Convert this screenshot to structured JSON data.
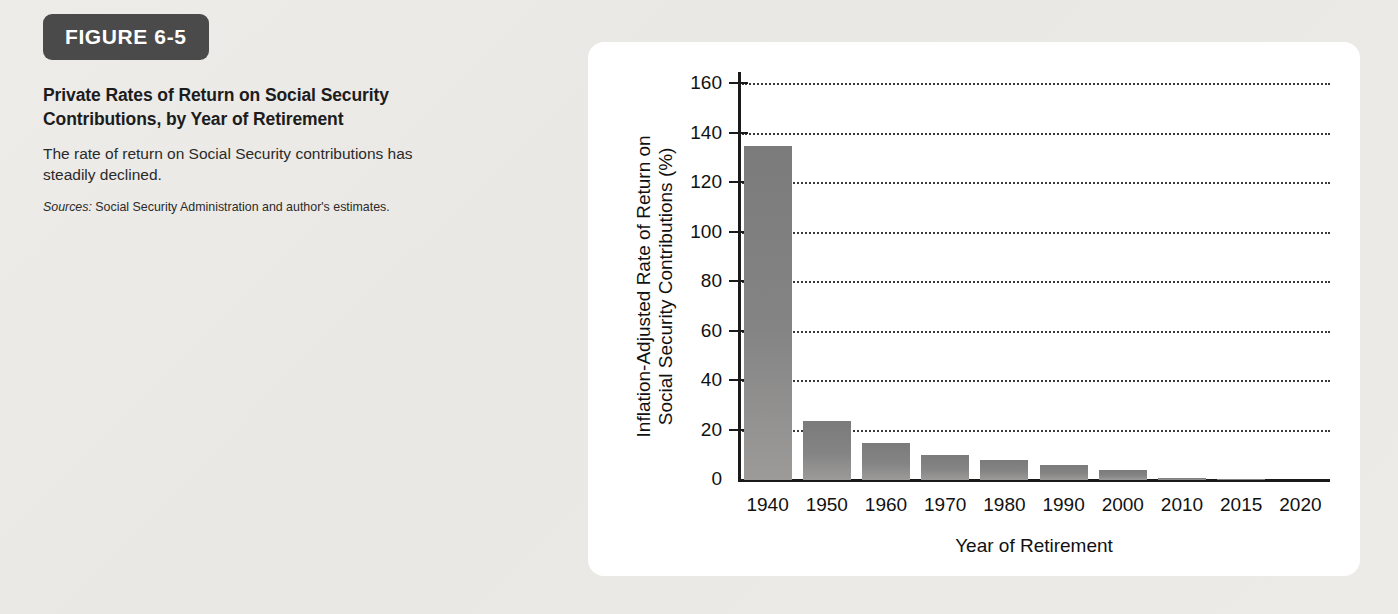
{
  "figure": {
    "badge": "FIGURE 6-5",
    "title": "Private Rates of Return on Social Security Contributions, by Year of Retirement",
    "description": "The rate of return on Social Security contributions has steadily declined.",
    "source_label": "Sources:",
    "source_text": " Social Security Administration and author's estimates."
  },
  "colors": {
    "page_background": "#eeece9",
    "badge_background": "#4a4a4a",
    "badge_text": "#ffffff",
    "card_background": "#ffffff",
    "bar_fill": "#858484",
    "axis": "#1a1a1a",
    "gridline": "#3a3a3a"
  },
  "chart_data": {
    "type": "bar",
    "title": "Private Rates of Return on Social Security Contributions, by Year of Retirement",
    "xlabel": "Year of Retirement",
    "ylabel": "Inflation-Adjusted Rate of Return on\nSocial Security Contributions (%)",
    "categories": [
      "1940",
      "1950",
      "1960",
      "1970",
      "1980",
      "1990",
      "2000",
      "2010",
      "2015",
      "2020"
    ],
    "values": [
      135,
      24,
      15,
      10,
      8,
      6,
      4,
      1,
      0.5,
      0
    ],
    "ylim": [
      0,
      160
    ],
    "yticks": [
      0,
      20,
      40,
      60,
      80,
      100,
      120,
      140,
      160
    ],
    "ytick_labels": [
      "0",
      "20",
      "40",
      "60",
      "80",
      "100",
      "120",
      "140",
      "160"
    ],
    "grid": "horizontal-dotted",
    "legend": "none"
  }
}
